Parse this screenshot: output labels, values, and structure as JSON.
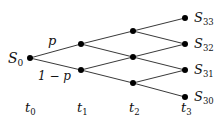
{
  "diagram": {
    "type": "binomial-tree",
    "start_label": "S",
    "start_sub": "0",
    "edge_labels": {
      "up": "p",
      "down": "1 − p"
    },
    "time_labels": [
      {
        "base": "t",
        "sub": "0"
      },
      {
        "base": "t",
        "sub": "1"
      },
      {
        "base": "t",
        "sub": "2"
      },
      {
        "base": "t",
        "sub": "3"
      }
    ],
    "terminal_labels": [
      {
        "base": "S",
        "sub": "33"
      },
      {
        "base": "S",
        "sub": "32"
      },
      {
        "base": "S",
        "sub": "31"
      },
      {
        "base": "S",
        "sub": "30"
      }
    ]
  }
}
